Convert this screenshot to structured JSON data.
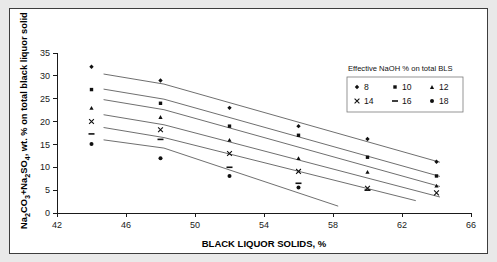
{
  "figure": {
    "background_color": "#e9e9e9",
    "panel_color": "#ffffff",
    "border_color": "#3d3d3d"
  },
  "chart_data": {
    "type": "scatter",
    "title": "",
    "xlabel": "BLACK LIQUOR SOLIDS, %",
    "ylabel": "Na2CO3+Na2SO4, wt. % on total black liquor solid",
    "ylabel_parts": {
      "seg1": "Na",
      "sub1": "2",
      "seg2": "CO",
      "sub2": "3",
      "seg3": "+Na",
      "sub3": "2",
      "seg4": "SO",
      "sub4": "4",
      "seg5": ", wt. % on total black liquor solid"
    },
    "xlim": [
      42,
      66
    ],
    "ylim": [
      0,
      35
    ],
    "xticks": [
      42,
      46,
      50,
      54,
      58,
      62,
      66
    ],
    "yticks": [
      0,
      5,
      10,
      15,
      20,
      25,
      30,
      35
    ],
    "grid": false,
    "legend_position": "upper-right",
    "legend_title": "Effective NaOH % on total BLS",
    "series": [
      {
        "name": "8",
        "marker": "diamond",
        "x": [
          44,
          48,
          52,
          56,
          60,
          64
        ],
        "y": [
          32.0,
          29.0,
          23.0,
          19.0,
          16.2,
          11.2
        ],
        "trend_x": [
          44.7,
          48.2,
          64.2
        ],
        "trend_y": [
          30.4,
          28.2,
          11.1
        ]
      },
      {
        "name": "10",
        "marker": "square",
        "x": [
          44,
          48,
          52,
          56,
          60,
          64
        ],
        "y": [
          27.0,
          24.0,
          19.0,
          17.0,
          12.2,
          8.1
        ],
        "trend_x": [
          44.7,
          48.2,
          64.2
        ],
        "trend_y": [
          27.1,
          24.9,
          8.0
        ]
      },
      {
        "name": "12",
        "marker": "triangle",
        "x": [
          44,
          48,
          52,
          56,
          60,
          64
        ],
        "y": [
          23.0,
          21.0,
          16.0,
          12.0,
          9.0,
          6.0
        ],
        "trend_x": [
          44.7,
          48.2,
          64.2
        ],
        "trend_y": [
          24.8,
          22.6,
          5.8
        ]
      },
      {
        "name": "14",
        "marker": "cross",
        "x": [
          44,
          48,
          52,
          56,
          60,
          64
        ],
        "y": [
          20.0,
          18.2,
          13.0,
          9.1,
          5.4,
          4.4
        ],
        "trend_x": [
          44.7,
          48.2,
          64.2
        ],
        "trend_y": [
          21.5,
          19.3,
          3.5
        ]
      },
      {
        "name": "16",
        "marker": "dash",
        "x": [
          44,
          48,
          52,
          56,
          60
        ],
        "y": [
          17.3,
          16.1,
          10.0,
          6.5,
          5.0
        ],
        "trend_x": [
          44.7,
          48.2,
          62.8
        ],
        "trend_y": [
          18.7,
          16.5,
          2.7
        ]
      },
      {
        "name": "18",
        "marker": "circle",
        "x": [
          44,
          48,
          52,
          56
        ],
        "y": [
          15.1,
          12.0,
          8.1,
          5.6
        ],
        "trend_x": [
          44.7,
          48.2,
          58.3
        ],
        "trend_y": [
          16.0,
          14.2,
          1.5
        ]
      }
    ],
    "legend_entries": [
      {
        "label": "8",
        "marker": "diamond"
      },
      {
        "label": "10",
        "marker": "square"
      },
      {
        "label": "12",
        "marker": "triangle"
      },
      {
        "label": "14",
        "marker": "cross"
      },
      {
        "label": "16",
        "marker": "dash"
      },
      {
        "label": "18",
        "marker": "circle"
      }
    ]
  }
}
